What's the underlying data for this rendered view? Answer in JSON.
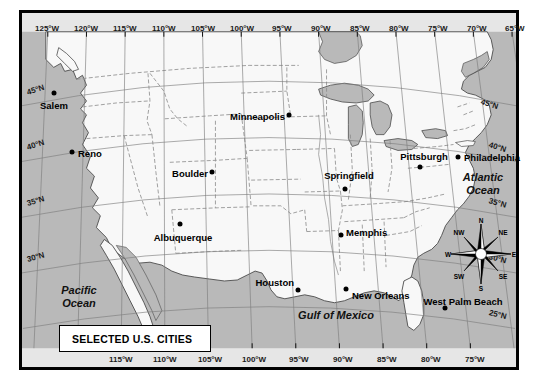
{
  "map": {
    "legend_title": "SELECTED U.S. CITIES",
    "longitude_labels_top": [
      "125°W",
      "120°W",
      "115°W",
      "110°W",
      "105°W",
      "100°W",
      "95°W",
      "90°W",
      "85°W",
      "80°W",
      "75°W",
      "70°W",
      "65°W"
    ],
    "longitude_labels_bottom": [
      "115°W",
      "110°W",
      "105°W",
      "100°W",
      "95°W",
      "90°W",
      "85°W",
      "80°W",
      "75°W"
    ],
    "latitude_labels_left": [
      "45°N",
      "40°N",
      "35°N",
      "30°N"
    ],
    "latitude_labels_right": [
      "45°N",
      "40°N",
      "35°N",
      "30°N",
      "25°N"
    ],
    "cities": [
      {
        "name": "Salem",
        "label_side": "center"
      },
      {
        "name": "Reno",
        "label_side": "right"
      },
      {
        "name": "Boulder",
        "label_side": "left"
      },
      {
        "name": "Albuquerque",
        "label_side": "center"
      },
      {
        "name": "Minneapolis",
        "label_side": "left"
      },
      {
        "name": "Springfield",
        "label_side": "center"
      },
      {
        "name": "Memphis",
        "label_side": "right"
      },
      {
        "name": "Houston",
        "label_side": "left"
      },
      {
        "name": "New Orleans",
        "label_side": "right"
      },
      {
        "name": "Pittsburgh",
        "label_side": "center"
      },
      {
        "name": "Philadelphia",
        "label_side": "right"
      },
      {
        "name": "West Palm Beach",
        "label_side": "center"
      }
    ],
    "water_bodies": [
      {
        "name": "Pacific\nOcean"
      },
      {
        "name": "Atlantic\nOcean"
      },
      {
        "name": "Gulf of Mexico"
      }
    ],
    "water_labels": {
      "pacific_line1": "Pacific",
      "pacific_line2": "Ocean",
      "atlantic_line1": "Atlantic",
      "atlantic_line2": "Ocean",
      "gulf": "Gulf of Mexico"
    },
    "compass": {
      "n": "N",
      "ne": "NE",
      "e": "E",
      "se": "SE",
      "s": "S",
      "sw": "SW",
      "w": "W",
      "nw": "NW"
    },
    "colors": {
      "water": "#b8b8b8",
      "land": "#f7f7f7",
      "border": "#666666",
      "graticule": "#8a8a8a",
      "frame": "#000000",
      "lakes": "#b8b8b8"
    }
  }
}
